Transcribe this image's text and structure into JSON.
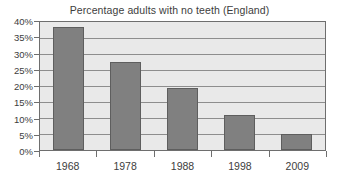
{
  "chart_data": {
    "type": "bar",
    "title": "Percentage adults with no teeth (England)",
    "xlabel": "",
    "ylabel": "",
    "categories": [
      "1968",
      "1978",
      "1988",
      "1998",
      "2009"
    ],
    "values": [
      38.5,
      27.5,
      19.5,
      11,
      5
    ],
    "ylim": [
      0,
      40
    ],
    "ytick_step": 5,
    "ytick_labels": [
      "0%",
      "5%",
      "10%",
      "15%",
      "20%",
      "25%",
      "30%",
      "35%",
      "40%"
    ],
    "ytick_values": [
      0,
      5,
      10,
      15,
      20,
      25,
      30,
      35,
      40
    ],
    "grid": true,
    "legend": false,
    "series": [
      {
        "name": "Percentage adults with no teeth",
        "values": [
          38.5,
          27.5,
          19.5,
          11,
          5
        ]
      }
    ],
    "colors": {
      "bar_fill": "#808080",
      "bar_edge": "#5e5e5e",
      "plot_background": "#e9e9e9",
      "gridline": "#8d8d8d",
      "axis": "#6e6e6e",
      "text": "#3d3d3d",
      "figure_background": "#ffffff"
    }
  }
}
